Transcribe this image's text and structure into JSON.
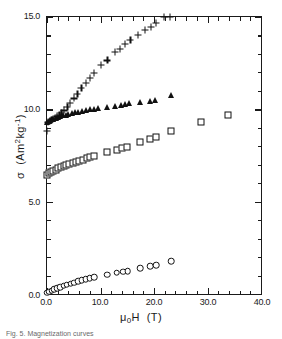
{
  "figure": {
    "caption": "Fig. 5. Magnetization curves"
  },
  "chart_data": {
    "type": "scatter",
    "title": "",
    "xlabel": "μ₀H  (T)",
    "ylabel": "σ  (Am²kg⁻¹)",
    "xlim": [
      0.0,
      40.0
    ],
    "ylim": [
      0.0,
      15.0
    ],
    "grid": false,
    "legend": "none",
    "xticks": [
      "0.0",
      "10.0",
      "20.0",
      "30.0",
      "40.0"
    ],
    "xtick_values": [
      0,
      10,
      20,
      30,
      40
    ],
    "xminor_step": 2,
    "yticks": [
      "0.0",
      "5.0",
      "10.0",
      "15.0"
    ],
    "ytick_values": [
      0,
      5,
      10,
      15
    ],
    "yminor_step": 1,
    "series": [
      {
        "name": "series-plus",
        "marker": "plus",
        "points": [
          [
            0.0,
            8.85
          ],
          [
            0.2,
            9.3
          ],
          [
            0.5,
            9.38
          ],
          [
            0.8,
            9.42
          ],
          [
            1.1,
            9.47
          ],
          [
            1.5,
            9.52
          ],
          [
            1.9,
            9.62
          ],
          [
            2.3,
            9.7
          ],
          [
            2.7,
            9.8
          ],
          [
            3.2,
            9.95
          ],
          [
            3.8,
            10.15
          ],
          [
            4.3,
            10.35
          ],
          [
            5.0,
            10.6
          ],
          [
            5.7,
            10.85
          ],
          [
            6.4,
            11.15
          ],
          [
            7.2,
            11.45
          ],
          [
            8.0,
            11.72
          ],
          [
            8.8,
            11.98
          ],
          [
            10.0,
            12.42
          ],
          [
            11.3,
            12.65
          ],
          [
            12.7,
            13.12
          ],
          [
            13.6,
            13.28
          ],
          [
            14.6,
            13.55
          ],
          [
            15.6,
            13.78
          ],
          [
            17.0,
            14.02
          ],
          [
            18.3,
            14.3
          ],
          [
            19.4,
            14.45
          ],
          [
            20.4,
            14.68
          ],
          [
            21.8,
            15.0
          ],
          [
            23.0,
            15.0
          ]
        ]
      },
      {
        "name": "series-triangle",
        "marker": "triangle",
        "points": [
          [
            0.0,
            9.32
          ],
          [
            0.3,
            9.38
          ],
          [
            0.6,
            9.42
          ],
          [
            0.9,
            9.46
          ],
          [
            1.2,
            9.5
          ],
          [
            1.6,
            9.55
          ],
          [
            2.0,
            9.6
          ],
          [
            2.5,
            9.64
          ],
          [
            3.0,
            9.68
          ],
          [
            3.5,
            9.72
          ],
          [
            4.0,
            9.76
          ],
          [
            4.6,
            9.8
          ],
          [
            5.2,
            9.84
          ],
          [
            5.8,
            9.88
          ],
          [
            6.5,
            9.92
          ],
          [
            7.2,
            9.96
          ],
          [
            8.0,
            10.0
          ],
          [
            8.8,
            10.04
          ],
          [
            9.6,
            10.08
          ],
          [
            11.3,
            10.1
          ],
          [
            12.8,
            10.18
          ],
          [
            13.8,
            10.22
          ],
          [
            14.6,
            10.28
          ],
          [
            15.4,
            10.32
          ],
          [
            17.3,
            10.38
          ],
          [
            19.2,
            10.45
          ],
          [
            20.2,
            10.48
          ],
          [
            23.1,
            10.75
          ]
        ]
      },
      {
        "name": "series-square",
        "marker": "square",
        "points": [
          [
            0.0,
            6.42
          ],
          [
            0.4,
            6.55
          ],
          [
            0.8,
            6.62
          ],
          [
            1.2,
            6.68
          ],
          [
            1.6,
            6.74
          ],
          [
            2.1,
            6.8
          ],
          [
            2.6,
            6.86
          ],
          [
            3.1,
            6.92
          ],
          [
            3.6,
            6.98
          ],
          [
            4.2,
            7.04
          ],
          [
            4.8,
            7.1
          ],
          [
            5.4,
            7.16
          ],
          [
            6.0,
            7.22
          ],
          [
            6.7,
            7.28
          ],
          [
            7.4,
            7.34
          ],
          [
            8.1,
            7.42
          ],
          [
            8.8,
            7.5
          ],
          [
            11.2,
            7.7
          ],
          [
            13.0,
            7.82
          ],
          [
            14.1,
            7.9
          ],
          [
            15.0,
            7.98
          ],
          [
            17.4,
            8.22
          ],
          [
            19.3,
            8.42
          ],
          [
            20.4,
            8.48
          ],
          [
            23.2,
            8.82
          ],
          [
            28.8,
            9.3
          ],
          [
            33.8,
            9.72
          ]
        ]
      },
      {
        "name": "series-circle",
        "marker": "circle",
        "points": [
          [
            0.0,
            0.06
          ],
          [
            0.4,
            0.12
          ],
          [
            0.9,
            0.18
          ],
          [
            1.4,
            0.25
          ],
          [
            1.9,
            0.32
          ],
          [
            2.5,
            0.38
          ],
          [
            3.1,
            0.45
          ],
          [
            3.7,
            0.5
          ],
          [
            4.4,
            0.56
          ],
          [
            5.1,
            0.62
          ],
          [
            5.8,
            0.68
          ],
          [
            6.5,
            0.74
          ],
          [
            7.2,
            0.8
          ],
          [
            8.0,
            0.86
          ],
          [
            8.8,
            0.92
          ],
          [
            11.2,
            1.05
          ],
          [
            13.0,
            1.15
          ],
          [
            14.2,
            1.2
          ],
          [
            15.1,
            1.25
          ],
          [
            17.4,
            1.4
          ],
          [
            19.3,
            1.52
          ],
          [
            20.4,
            1.55
          ],
          [
            23.2,
            1.78
          ]
        ]
      }
    ]
  }
}
